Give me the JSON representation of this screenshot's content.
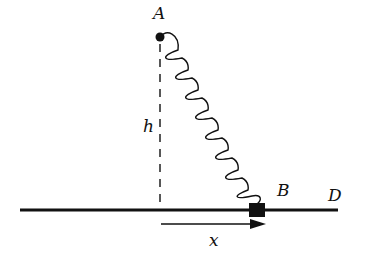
{
  "diagram": {
    "type": "physics-spring-mechanics",
    "labels": {
      "point_a": "A",
      "point_b": "B",
      "point_d": "D",
      "height": "h",
      "displacement": "x"
    },
    "elements": {
      "anchor": "fixed point A (pivot dot)",
      "spring": "coil spring from A to block B",
      "spring_coils": 9,
      "block": "small square block B on horizontal rail",
      "rail": "horizontal line ending at D",
      "height_marker": "vertical dashed line of height h below A",
      "displacement_arrow": "arrow from foot of perpendicular to B, labeled x"
    },
    "colors": {
      "ink": "#111111",
      "background": "#ffffff"
    }
  }
}
